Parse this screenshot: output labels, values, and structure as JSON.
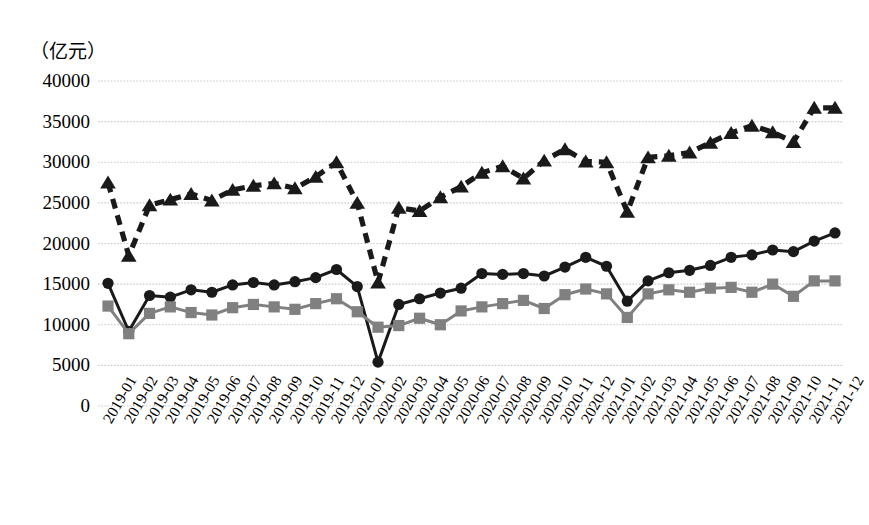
{
  "chart_data": {
    "type": "line",
    "title": "",
    "subtitle": "",
    "xlabel": "",
    "ylabel": "",
    "unit_label": "（亿元）",
    "ylim": [
      0,
      40000
    ],
    "ytick_values": [
      40000,
      35000,
      30000,
      25000,
      20000,
      15000,
      10000,
      5000,
      0
    ],
    "ytick_labels": [
      "40000",
      "35000",
      "30000",
      "25000",
      "20000",
      "15000",
      "10000",
      "5000",
      "0"
    ],
    "grid": true,
    "grid_axis": "y",
    "legend": "none",
    "categories": [
      "2019-01",
      "2019-02",
      "2019-03",
      "2019-04",
      "2019-05",
      "2019-06",
      "2019-07",
      "2019-08",
      "2019-09",
      "2019-10",
      "2019-11",
      "2019-12",
      "2020-01",
      "2020-02",
      "2020-03",
      "2020-04",
      "2020-05",
      "2020-06",
      "2020-07",
      "2020-08",
      "2020-09",
      "2020-10",
      "2020-11",
      "2020-12",
      "2021-01",
      "2021-02",
      "2021-03",
      "2021-04",
      "2021-05",
      "2021-06",
      "2021-07",
      "2021-08",
      "2021-09",
      "2021-10",
      "2021-11",
      "2021-12"
    ],
    "series": [
      {
        "name": "series-triangle-dashed",
        "marker": "triangle",
        "linestyle": "dashed",
        "color": "#1a1a1a",
        "values": [
          27500,
          18500,
          24700,
          25400,
          26100,
          25300,
          26600,
          27100,
          27400,
          26800,
          28200,
          30000,
          25000,
          15200,
          24400,
          24000,
          25700,
          27000,
          28700,
          29500,
          28000,
          30200,
          31600,
          30100,
          30000,
          23900,
          30600,
          30800,
          31200,
          32400,
          33600,
          34500,
          33700,
          32500,
          36700,
          36700
        ]
      },
      {
        "name": "series-circle-solid",
        "marker": "circle",
        "linestyle": "solid",
        "color": "#1a1a1a",
        "values": [
          15100,
          9200,
          13600,
          13400,
          14300,
          14000,
          14900,
          15200,
          14900,
          15300,
          15800,
          16800,
          14700,
          5400,
          12500,
          13200,
          13900,
          14500,
          16300,
          16200,
          16300,
          16000,
          17100,
          18300,
          17200,
          12900,
          15400,
          16400,
          16700,
          17300,
          18300,
          18600,
          19200,
          19000,
          20300,
          21300
        ]
      },
      {
        "name": "series-square-gray",
        "marker": "square",
        "linestyle": "solid",
        "color": "#808080",
        "values": [
          12300,
          8900,
          11400,
          12200,
          11500,
          11200,
          12100,
          12500,
          12200,
          11900,
          12600,
          13200,
          11600,
          9700,
          9900,
          10800,
          10000,
          11700,
          12200,
          12600,
          13000,
          12000,
          13700,
          14400,
          13800,
          10900,
          13800,
          14300,
          14000,
          14500,
          14600,
          14000,
          15000,
          13500,
          15400,
          15400
        ]
      }
    ]
  },
  "axes": {
    "plot_left_px": 98,
    "plot_right_px": 843,
    "plot_top_px": 81,
    "plot_bottom_px": 406
  }
}
